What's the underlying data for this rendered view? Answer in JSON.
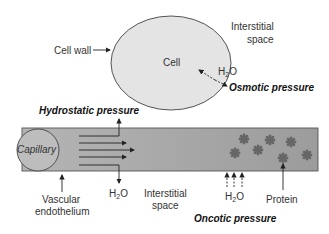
{
  "diagram": {
    "cell": {
      "label": "Cell",
      "cell_wall_label": "Cell wall",
      "fill": "#e4e4e4"
    },
    "interstitial_top": {
      "line1": "Interstitial",
      "line2": "space"
    },
    "osmotic": {
      "water": "H",
      "water_sub": "2",
      "water_o": "O",
      "label": "Osmotic pressure"
    },
    "hydrostatic": {
      "label": "Hydrostatic pressure",
      "water": "H",
      "water_sub": "2",
      "water_o": "O"
    },
    "capillary": {
      "label": "Capillary",
      "fill": "#a8a8a8"
    },
    "vascular": {
      "line1": "Vascular",
      "line2": "endothelium"
    },
    "interstitial_bottom": {
      "line1": "Interstitial",
      "line2": "space"
    },
    "oncotic": {
      "water": "H",
      "water_sub": "2",
      "water_o": "O",
      "label": "Oncotic pressure"
    },
    "protein": {
      "label": "Protein",
      "color": "#6e6e6e"
    }
  }
}
